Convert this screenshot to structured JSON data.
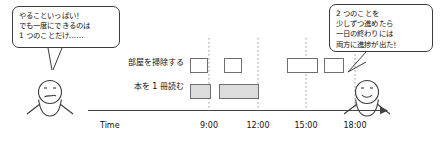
{
  "figure": {
    "caption_left_speaker": "frustrated-person",
    "caption_right_speaker": "satisfied-person"
  },
  "bubbles": {
    "left": {
      "lines": [
        "やることいっぱい！",
        "でも一度にできるのは",
        "1 つのことだけ……"
      ]
    },
    "right": {
      "lines": [
        "2 つのことを",
        "少しずつ進めたら",
        "一日の終わりには",
        "両方に進捗が出た！"
      ]
    }
  },
  "chart_data": {
    "type": "timeline",
    "title": "",
    "xlabel": "Time",
    "ylabel": "",
    "grid": true,
    "legend_position": "none",
    "axis_label": "Time",
    "tick_labels": [
      "9:00",
      "12:00",
      "15:00",
      "18:00"
    ],
    "tick_x": [
      209,
      258,
      306,
      355
    ],
    "x_axis_start": 96,
    "x_axis_end": 382,
    "rows": [
      {
        "label": "部屋を掃除する",
        "fill": "white",
        "blocks": [
          {
            "start": 190,
            "end": 208,
            "y": 58,
            "height": 15,
            "filled": false
          },
          {
            "start": 224,
            "end": 242,
            "y": 58,
            "height": 15,
            "filled": false
          },
          {
            "start": 287,
            "end": 318,
            "y": 58,
            "height": 15,
            "filled": false
          },
          {
            "start": 324,
            "end": 344,
            "y": 58,
            "height": 15,
            "filled": false
          }
        ]
      },
      {
        "label": "本を 1 冊読む",
        "fill": "gray",
        "blocks": [
          {
            "start": 190,
            "end": 211,
            "y": 84,
            "height": 15,
            "filled": true
          },
          {
            "start": 219,
            "end": 259,
            "y": 84,
            "height": 15,
            "filled": true
          }
        ]
      }
    ]
  }
}
